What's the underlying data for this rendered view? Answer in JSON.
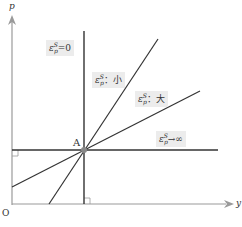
{
  "diagram": {
    "axes": {
      "y_axis_label": "p",
      "x_axis_label": "y",
      "origin_label": "O"
    },
    "point": {
      "label": "A"
    },
    "curves": [
      {
        "id": "vertical",
        "eps": "ε",
        "sup": "S",
        "sub": "p",
        "suffix": "=0"
      },
      {
        "id": "steep",
        "eps": "ε",
        "sup": "S",
        "sub": "p",
        "suffix": "：小"
      },
      {
        "id": "shallow",
        "eps": "ε",
        "sup": "S",
        "sub": "p",
        "suffix": "：大"
      },
      {
        "id": "horizontal",
        "eps": "ε",
        "sup": "S",
        "sub": "p",
        "suffix": "→∞"
      }
    ],
    "colors": {
      "axis": "#9a9a9a",
      "line": "#333333",
      "label_bg": "#ececec",
      "point": "#888888"
    }
  }
}
